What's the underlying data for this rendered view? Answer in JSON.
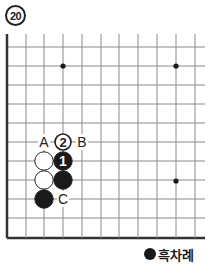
{
  "problem": {
    "number": "20"
  },
  "board": {
    "line_color": "#8a8a8a",
    "edge_color": "#333333",
    "columns_x": [
      7,
      26,
      44,
      63,
      82,
      101,
      119,
      138,
      157,
      176,
      195
    ],
    "rows_y": [
      47,
      66,
      85,
      104,
      123,
      142,
      161,
      180,
      199,
      218,
      238
    ],
    "edges": [
      "left",
      "bottom"
    ],
    "star_points": [
      {
        "x": 63,
        "y": 66
      },
      {
        "x": 176,
        "y": 66
      },
      {
        "x": 176,
        "y": 181
      }
    ],
    "stones": [
      {
        "color": "white",
        "x": 44,
        "y": 161,
        "label": ""
      },
      {
        "color": "black",
        "x": 63,
        "y": 161,
        "label": "1"
      },
      {
        "color": "white",
        "x": 44,
        "y": 180,
        "label": ""
      },
      {
        "color": "black",
        "x": 63,
        "y": 180,
        "label": ""
      },
      {
        "color": "black",
        "x": 44,
        "y": 199,
        "label": ""
      },
      {
        "color": "white",
        "x": 63,
        "y": 142,
        "label": "2",
        "style": "marker"
      }
    ],
    "letters": [
      {
        "text": "A",
        "x": 44,
        "y": 142
      },
      {
        "text": "B",
        "x": 82,
        "y": 142
      },
      {
        "text": "C",
        "x": 63,
        "y": 199
      }
    ]
  },
  "legend": {
    "label": "흑차례",
    "stone_color": "black"
  }
}
